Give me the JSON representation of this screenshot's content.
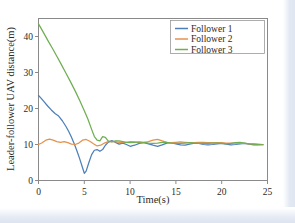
{
  "chart_data": {
    "type": "line",
    "title": "",
    "xlabel": "Time(s)",
    "ylabel": "Leader-follower UAV distance(m)",
    "xlim": [
      0,
      25
    ],
    "ylim": [
      0,
      45
    ],
    "xticks": [
      0,
      5,
      10,
      15,
      20,
      25
    ],
    "yticks": [
      0,
      10,
      20,
      30,
      40
    ],
    "xtick_labels": [
      "0",
      "5",
      "10",
      "15",
      "20",
      "25"
    ],
    "ytick_labels": [
      "0",
      "10",
      "20",
      "30",
      "40"
    ],
    "grid": false,
    "legend_position": "top-right",
    "colors": {
      "follower1": "#4d7fb8",
      "follower2": "#e4924e",
      "follower3": "#6fae52",
      "axis": "#8a8a8a",
      "text": "#2b2b2b"
    },
    "series": [
      {
        "name": "Follower 1",
        "color": "#4d7fb8",
        "x": [
          0,
          0.3,
          0.6,
          1.0,
          1.4,
          1.8,
          2.2,
          2.6,
          3.0,
          3.3,
          3.6,
          3.9,
          4.2,
          4.5,
          4.8,
          5.0,
          5.2,
          5.5,
          5.8,
          6.1,
          6.4,
          6.7,
          7.0,
          7.3,
          7.6,
          8.0,
          8.4,
          8.8,
          9.2,
          9.6,
          10.0,
          10.5,
          11.0,
          11.5,
          12.0,
          12.5,
          13.0,
          13.5,
          14.0,
          14.5,
          15.0,
          15.5,
          16.0,
          16.5,
          17.0,
          17.5,
          18.0,
          18.5,
          19.0,
          19.5,
          20.0,
          20.5,
          21.0,
          21.5,
          22.0,
          22.5,
          23.0,
          23.5,
          24.0,
          24.5
        ],
        "y": [
          23.6,
          22.8,
          21.9,
          20.7,
          19.6,
          18.6,
          17.9,
          16.6,
          15.0,
          13.6,
          12.0,
          10.2,
          8.2,
          6.0,
          3.6,
          2.0,
          2.6,
          5.0,
          7.2,
          8.4,
          8.6,
          8.1,
          8.6,
          9.8,
          10.6,
          11.1,
          10.6,
          10.1,
          10.4,
          10.0,
          9.5,
          9.8,
          10.3,
          10.5,
          10.2,
          9.8,
          9.5,
          9.9,
          10.4,
          10.5,
          10.2,
          9.9,
          9.8,
          10.1,
          10.4,
          10.3,
          10.0,
          9.9,
          10.0,
          10.2,
          10.3,
          10.1,
          9.9,
          10.0,
          10.2,
          10.3,
          10.1,
          9.9,
          9.9,
          10.0
        ]
      },
      {
        "name": "Follower 2",
        "color": "#e4924e",
        "x": [
          0,
          0.4,
          0.8,
          1.2,
          1.6,
          2.0,
          2.4,
          2.8,
          3.2,
          3.6,
          4.0,
          4.4,
          4.8,
          5.2,
          5.6,
          6.0,
          6.4,
          6.8,
          7.2,
          7.6,
          8.0,
          8.5,
          9.0,
          9.5,
          10.0,
          10.5,
          11.0,
          11.5,
          12.0,
          12.5,
          13.0,
          13.5,
          14.0,
          14.5,
          15.0,
          15.5,
          16.0,
          16.5,
          17.0,
          17.5,
          18.0,
          18.5,
          19.0,
          19.5,
          20.0,
          20.5,
          21.0,
          21.5,
          22.0,
          22.5,
          23.0,
          23.5,
          24.0,
          24.5
        ],
        "y": [
          10.0,
          10.5,
          11.2,
          11.5,
          11.2,
          10.8,
          10.6,
          10.8,
          10.5,
          10.1,
          10.0,
          10.4,
          11.2,
          11.4,
          10.9,
          10.2,
          9.6,
          9.8,
          10.4,
          10.8,
          10.9,
          10.7,
          10.5,
          10.6,
          10.8,
          10.7,
          10.5,
          10.6,
          10.8,
          11.2,
          11.4,
          11.0,
          10.6,
          10.5,
          10.6,
          10.7,
          10.6,
          10.5,
          10.5,
          10.6,
          10.6,
          10.5,
          10.5,
          10.5,
          10.5,
          10.4,
          10.4,
          10.4,
          10.3,
          10.3,
          10.2,
          10.2,
          10.1,
          10.0
        ]
      },
      {
        "name": "Follower 3",
        "color": "#6fae52",
        "x": [
          0,
          0.5,
          1.0,
          1.5,
          2.0,
          2.5,
          3.0,
          3.5,
          4.0,
          4.5,
          5.0,
          5.4,
          5.8,
          6.1,
          6.4,
          6.7,
          7.0,
          7.3,
          7.6,
          8.0,
          8.4,
          8.8,
          9.2,
          9.6,
          10.0,
          10.5,
          11.0,
          11.5,
          12.0,
          12.5,
          13.0,
          13.5,
          14.0,
          14.5,
          15.0,
          15.5,
          16.0,
          16.5,
          17.0,
          17.5,
          18.0,
          18.5,
          19.0,
          19.5,
          20.0,
          20.5,
          21.0,
          21.5,
          22.0,
          22.5,
          23.0,
          23.5,
          24.0,
          24.5
        ],
        "y": [
          43.5,
          41.3,
          39.0,
          36.8,
          34.5,
          32.2,
          29.8,
          27.4,
          24.9,
          22.2,
          19.4,
          17.0,
          14.2,
          12.2,
          11.2,
          11.0,
          12.2,
          12.0,
          11.0,
          10.7,
          11.0,
          11.0,
          10.8,
          10.6,
          10.5,
          10.6,
          10.7,
          10.6,
          10.4,
          10.3,
          10.4,
          10.6,
          10.6,
          10.4,
          10.3,
          10.3,
          10.4,
          10.5,
          10.4,
          10.3,
          10.3,
          10.3,
          10.4,
          10.4,
          10.3,
          10.2,
          10.3,
          10.5,
          10.6,
          10.4,
          10.2,
          10.1,
          10.0,
          9.9
        ]
      }
    ]
  },
  "legend": {
    "items": [
      {
        "label": "Follower 1"
      },
      {
        "label": "Follower 2"
      },
      {
        "label": "Follower 3"
      }
    ]
  },
  "axes": {
    "x_title": "Time(s)",
    "y_title": "Leader-follower UAV distance(m)"
  }
}
